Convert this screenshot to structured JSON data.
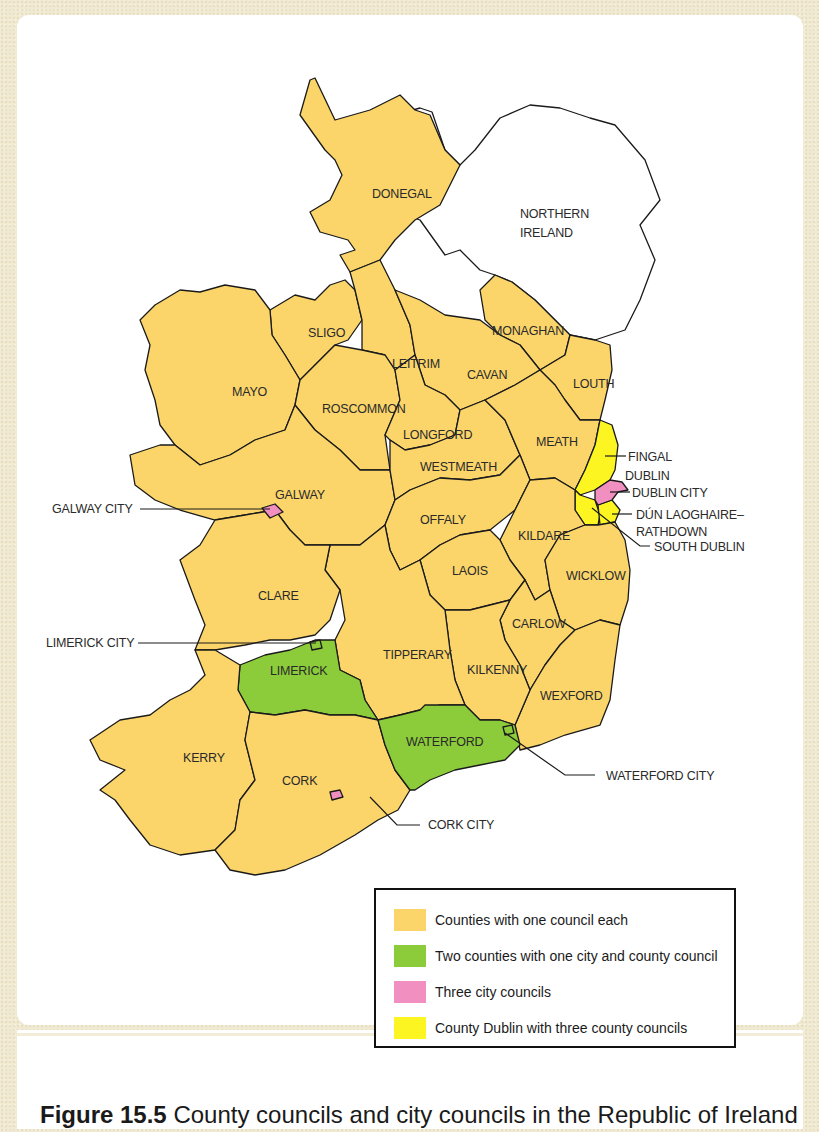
{
  "figure": {
    "number": "Figure 15.5",
    "caption": "County councils and city councils in the Republic of Ireland"
  },
  "colors": {
    "county": "#fbd56a",
    "city_county": "#8ccc3a",
    "city": "#f08fc0",
    "dublin": "#fdf522",
    "outline": "#1a1a1a",
    "northern_ireland": "#ffffff"
  },
  "map": {
    "title": "Republic of Ireland local councils",
    "regions": {
      "donegal": "DONEGAL",
      "northern_ireland_line1": "NORTHERN",
      "northern_ireland_line2": "IRELAND",
      "sligo": "SLIGO",
      "monaghan": "MONAGHAN",
      "leitrim": "LEITRIM",
      "cavan": "CAVAN",
      "louth": "LOUTH",
      "mayo": "MAYO",
      "roscommon": "ROSCOMMON",
      "longford": "LONGFORD",
      "meath": "MEATH",
      "westmeath": "WESTMEATH",
      "galway": "GALWAY",
      "offaly": "OFFALY",
      "kildare": "KILDARE",
      "laois": "LAOIS",
      "wicklow": "WICKLOW",
      "clare": "CLARE",
      "carlow": "CARLOW",
      "limerick": "LIMERICK",
      "tipperary": "TIPPERARY",
      "kilkenny": "KILKENNY",
      "wexford": "WEXFORD",
      "waterford": "WATERFORD",
      "kerry": "KERRY",
      "cork": "CORK"
    },
    "callouts": {
      "fingal": "FINGAL",
      "dublin": "DUBLIN",
      "dublin_city": "DUBLIN CITY",
      "dun_laoghaire_line1": "DÚN LAOGHAIRE–",
      "dun_laoghaire_line2": "RATHDOWN",
      "south_dublin": "SOUTH DUBLIN",
      "galway_city": "GALWAY CITY",
      "limerick_city": "LIMERICK CITY",
      "waterford_city": "WATERFORD CITY",
      "cork_city": "CORK CITY"
    }
  },
  "legend": {
    "items": [
      {
        "label": "Counties with one council each",
        "color": "#fbd56a"
      },
      {
        "label": "Two counties with one city and county council",
        "color": "#8ccc3a"
      },
      {
        "label": "Three city councils",
        "color": "#f08fc0"
      },
      {
        "label": "County Dublin with three county councils",
        "color": "#fdf522"
      }
    ]
  }
}
